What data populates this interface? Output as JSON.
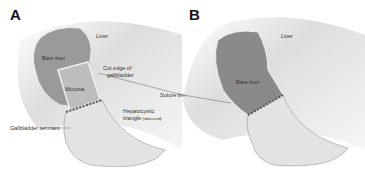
{
  "panels": [
    {
      "letter": "A",
      "labels": {
        "liver": "Liver",
        "bare_liver": "Bare liver",
        "cut_edge_1": "Cut edge of",
        "cut_edge_2": "gallbladder",
        "mucosa": "Mucosa",
        "suture_line": "Suture line",
        "hepatocystic_1": "Hepatocystic",
        "hepatocystic_2": "triangle",
        "hepatocystic_note": "(obscured)",
        "remnant": "Gallbladder remnant"
      }
    },
    {
      "letter": "B",
      "labels": {
        "liver": "Liver",
        "bare_liver": "Bare liver"
      }
    }
  ],
  "colors": {
    "background": "#ffffff",
    "tissue_dark": "#8a8a8a",
    "tissue_light": "#d8d8d8",
    "line": "#444444"
  }
}
